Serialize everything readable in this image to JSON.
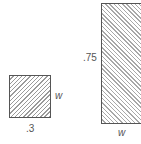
{
  "figures": [
    {
      "name": "small-square",
      "bottom_label": ".3",
      "side_label": "w"
    },
    {
      "name": "tall-rectangle",
      "side_label": ".75",
      "bottom_label": "w"
    }
  ]
}
